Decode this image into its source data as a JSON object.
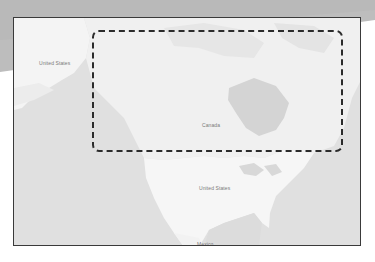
{
  "map": {
    "style": "grayscale",
    "region": "North America",
    "labels": {
      "alaska": "United States",
      "canada": "Canada",
      "usa": "United States",
      "mexico": "Mexico"
    },
    "highlight": {
      "shape": "dashed-rounded-rectangle",
      "covers": "Canada"
    }
  },
  "colors": {
    "water": "#e2e2e2",
    "land": "#f3f3f3",
    "lake": "#d6d6d6",
    "frame_border": "#3a3a3a",
    "highlight_border": "#2b2b2b",
    "background_band": "#b9b9b9",
    "label": "#7a7a7a"
  }
}
